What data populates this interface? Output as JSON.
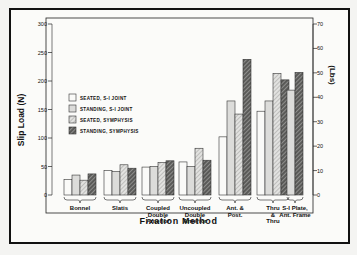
{
  "chart_data": {
    "type": "bar",
    "title": "",
    "xlabel": "Fixation Method",
    "ylabel": "Slip Load (N)",
    "ylabel_right": "(Lbs)",
    "ylim": [
      0,
      300
    ],
    "ylim_right": [
      0,
      70
    ],
    "yticks": [
      0,
      50,
      100,
      150,
      200,
      250,
      300
    ],
    "yticks_right": [
      0,
      10,
      20,
      30,
      40,
      50,
      60,
      70
    ],
    "grid": false,
    "legend_position": "upper-left inside plot",
    "categories": [
      "Bonnel",
      "Slatis",
      "Coupled Double Anterior",
      "Uncoupled Double Anterior",
      "Ant. & Post.",
      "Thru & Thru",
      "S-I Plate, Ant. Frame"
    ],
    "series": [
      {
        "name": "SEATED, S-I JOINT",
        "pattern": "white",
        "values": [
          27,
          43,
          49,
          58,
          102,
          147,
          null
        ]
      },
      {
        "name": "STANDING, S-I JOINT",
        "pattern": "light-gray",
        "values": [
          35,
          41,
          50,
          50,
          165,
          165,
          184
        ]
      },
      {
        "name": "SEATED, SYMPHYSIS",
        "pattern": "light-hatch",
        "values": [
          26,
          53,
          57,
          82,
          142,
          213,
          null
        ]
      },
      {
        "name": "STANDING, SYMPHYSIS",
        "pattern": "dark-hatch",
        "values": [
          37,
          47,
          60,
          61,
          238,
          202,
          215
        ]
      }
    ]
  },
  "labels": {
    "xlabel": "Fixation Method",
    "ylabel": "Slip Load (N)",
    "ylabel_right": "(Lbs)",
    "cat_lines": [
      [
        "Bonnel"
      ],
      [
        "Slatis"
      ],
      [
        "Coupled",
        "Double",
        "Anterior"
      ],
      [
        "Uncoupled",
        "Double",
        "Anterior"
      ],
      [
        "Ant. &",
        "Post."
      ],
      [
        "Thru",
        "&",
        "Thru"
      ],
      [
        "S-I Plate,",
        "Ant. Frame"
      ]
    ]
  }
}
